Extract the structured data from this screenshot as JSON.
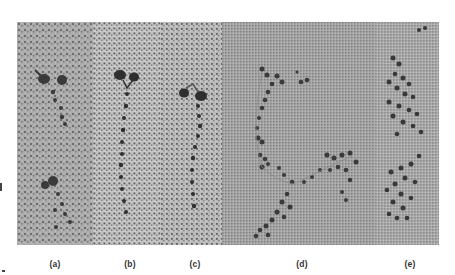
{
  "figure": {
    "type": "electron micrograph panels",
    "panels": [
      {
        "id": "a",
        "label": "(a)",
        "x": 0,
        "width": 76,
        "bg": "#a9a9a9",
        "structure": "two Y-shaped molecules with globular heads"
      },
      {
        "id": "b",
        "label": "(b)",
        "x": 76,
        "width": 67,
        "bg": "#bcbcbc",
        "structure": "single molecule, two heads and long tail"
      },
      {
        "id": "c",
        "label": "(c)",
        "x": 143,
        "width": 62,
        "bg": "#b5b5b5",
        "structure": "single molecule, two heads and long tail"
      },
      {
        "id": "d",
        "label": "(d)",
        "x": 205,
        "width": 153,
        "bg": "#a0a0a0",
        "structure": "extended multi-molecule assembly"
      },
      {
        "id": "e",
        "label": "(e)",
        "x": 358,
        "width": 64,
        "bg": "#a6a6a6",
        "structure": "clustered aggregate"
      }
    ]
  },
  "labels": {
    "a": "(a)",
    "b": "(b)",
    "c": "(c)",
    "d": "(d)",
    "e": "(e)"
  },
  "colors": {
    "background": "#ffffff",
    "particle": "#2e2e2e",
    "label": "#333333"
  }
}
